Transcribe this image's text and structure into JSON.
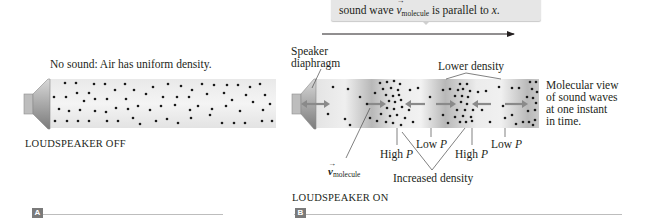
{
  "callout": {
    "text_prefix": "sound wave ",
    "vector_symbol": "v",
    "vector_subscript": "molecule",
    "text_suffix": " is parallel to ",
    "axis_var": "x",
    "period": "."
  },
  "axis": {
    "label": "x"
  },
  "panel_a": {
    "tag": "A",
    "heading": "No sound: Air has uniform density.",
    "caption": "LOUDSPEAKER OFF"
  },
  "panel_b": {
    "tag": "B",
    "speaker_label_line1": "Speaker",
    "speaker_label_line2": "diaphragm",
    "lower_density_label": "Lower density",
    "side_note": [
      "Molecular view",
      "of sound waves",
      "at one instant",
      "in time."
    ],
    "high_p_1": "High ",
    "low_p_1": "Low ",
    "high_p_2": "High ",
    "low_p_2": "Low ",
    "p_symbol": "P",
    "vector_symbol": "v",
    "vector_subscript": "molecule",
    "increased_density_label": "Increased density",
    "caption": "LOUDSPEAKER ON"
  },
  "colors": {
    "tube_light": "#f1f1f1",
    "tube_dark": "#b5b5b5",
    "arrow": "#8a8a8a",
    "dot": "#1a1a1a",
    "callout_bg": "#e6e6e6",
    "tag_bg": "#7a7a7a"
  }
}
